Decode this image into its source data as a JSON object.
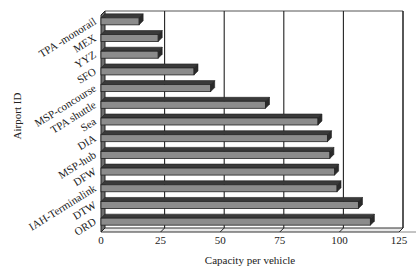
{
  "chart_data": {
    "type": "bar",
    "orientation": "horizontal",
    "style": "3d",
    "title": "",
    "xlabel": "Capacity per vehicle",
    "ylabel": "Airport ID",
    "xlim": [
      0,
      125
    ],
    "xticks": [
      0,
      25,
      50,
      75,
      100,
      125
    ],
    "grid": "vertical",
    "legend": "none",
    "categories": [
      "TPA -monorail",
      "MEX",
      "YYZ",
      "SFO",
      "MSP-concourse",
      "TPA shuttle",
      "Sea",
      "DIA",
      "MSP-hub",
      "DFW",
      "IAH-Terminalink",
      "DTW",
      "ORD"
    ],
    "values": [
      16,
      24,
      24,
      39,
      46,
      69,
      91,
      95,
      96,
      98,
      99,
      108,
      113
    ],
    "bar_color": "#8c8c8c",
    "bar_edge_color": "#222222"
  }
}
